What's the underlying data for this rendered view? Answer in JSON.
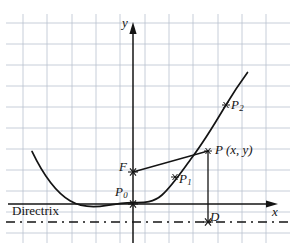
{
  "figure": {
    "kind": "parabola-focus-directrix-diagram",
    "colors": {
      "grid": "#b9c2cf",
      "axis": "#141414",
      "curve": "#141414",
      "ray": "#141414",
      "directrix": "#141414",
      "text": "#141414",
      "background": "#ffffff"
    },
    "grid": {
      "visible": true,
      "spacing_x": 24.3,
      "spacing_y": 21.2,
      "x_lines": [
        23,
        47,
        72,
        96,
        120,
        145,
        169,
        193,
        218,
        242,
        266
      ],
      "y_lines": [
        23,
        44,
        65,
        86,
        107,
        128,
        149,
        170,
        191,
        212,
        233
      ]
    },
    "axes": {
      "origin": {
        "x": 133,
        "y": 204
      },
      "x_axis": {
        "label": "x",
        "from_x": 8,
        "to_x": 278,
        "y": 204,
        "arrow": true
      },
      "y_axis": {
        "label": "y",
        "x": 133,
        "from_y": 243,
        "to_y": 24,
        "arrow": true
      }
    },
    "directrix": {
      "label": "Directrix",
      "y": 222,
      "from_x": 6,
      "to_x": 290,
      "style": "dash-dot"
    },
    "curve": {
      "type": "parabola",
      "vertex": {
        "x": 133,
        "y": 204
      },
      "opens": "up",
      "a": 0.0145,
      "x_start": 32,
      "x_end": 248
    },
    "points": [
      {
        "name": "F",
        "label": "F",
        "sub": "",
        "x": 133,
        "y": 172,
        "marker": "star",
        "label_dx": -14,
        "label_dy": -12,
        "role": "focus"
      },
      {
        "name": "P0",
        "label": "P",
        "sub": "0",
        "x": 133,
        "y": 204,
        "marker": "star",
        "label_dx": -18,
        "label_dy": -19,
        "role": "vertex"
      },
      {
        "name": "P1",
        "label": "P",
        "sub": "1",
        "x": 175,
        "y": 177,
        "marker": "star",
        "label_dx": 4,
        "label_dy": -5,
        "role": "curve-point"
      },
      {
        "name": "P",
        "label": "P (x, y)",
        "sub": "",
        "x": 208,
        "y": 151,
        "marker": "star",
        "label_dx": 7,
        "label_dy": -8,
        "role": "general-point"
      },
      {
        "name": "P2",
        "label": "P",
        "sub": "2",
        "x": 226,
        "y": 105,
        "marker": "star",
        "label_dx": 5,
        "label_dy": -7,
        "role": "curve-point"
      },
      {
        "name": "D",
        "label": "D",
        "sub": "",
        "x": 208,
        "y": 222,
        "marker": "star",
        "label_dx": 2,
        "label_dy": -12,
        "role": "foot-on-directrix"
      }
    ],
    "segments": [
      {
        "name": "focal-radius-FP",
        "from": "F",
        "to": "P",
        "x1": 133,
        "y1": 172,
        "x2": 208,
        "y2": 151,
        "style": "solid"
      },
      {
        "name": "perpendicular-PD",
        "from": "P",
        "to": "D",
        "x1": 208,
        "y1": 151,
        "x2": 208,
        "y2": 222,
        "style": "solid"
      }
    ],
    "labels": {
      "y_axis": "y",
      "x_axis": "x",
      "focus": "F",
      "vertex_base": "P",
      "vertex_sub": "0",
      "p1_base": "P",
      "p1_sub": "1",
      "p2_base": "P",
      "p2_sub": "2",
      "point_general": "P (x, y)",
      "foot": "D",
      "directrix": "Directrix"
    }
  }
}
